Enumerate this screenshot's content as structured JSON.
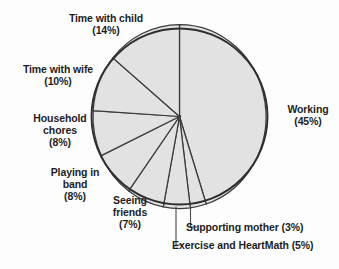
{
  "chart_data": {
    "type": "pie",
    "title": "",
    "subtitle": "",
    "xlabel": "",
    "ylabel": "",
    "grid": false,
    "legend_position": "callout-labels",
    "start_angle_deg": 0,
    "direction": "clockwise",
    "slice_fill_color": "#e2e2e2",
    "slice_border_color": "#3a3a3a",
    "background_color": "#fdfdfd",
    "categories": [
      "Working",
      "Supporting mother",
      "Exercise and HeartMath",
      "Seeing friends",
      "Playing in band",
      "Household chores",
      "Time with wife",
      "Time with child"
    ],
    "values": [
      45,
      3,
      5,
      7,
      8,
      8,
      10,
      14
    ],
    "total": 100,
    "slices": [
      {
        "name": "Working",
        "value": 45,
        "percent_label": "(45%)",
        "label_line1": "Working",
        "label_line2": "(45%)"
      },
      {
        "name": "Supporting mother",
        "value": 3,
        "percent_label": "(3%)",
        "label_line1": "Supporting mother (3%)",
        "label_line2": ""
      },
      {
        "name": "Exercise and HeartMath",
        "value": 5,
        "percent_label": "(5%)",
        "label_line1": "Exercise and HeartMath (5%)",
        "label_line2": ""
      },
      {
        "name": "Seeing friends",
        "value": 7,
        "percent_label": "(7%)",
        "label_line1": "Seeing",
        "label_line2": "friends",
        "label_line3": "(7%)"
      },
      {
        "name": "Playing in band",
        "value": 8,
        "percent_label": "(8%)",
        "label_line1": "Playing in",
        "label_line2": "band",
        "label_line3": "(8%)"
      },
      {
        "name": "Household chores",
        "value": 8,
        "percent_label": "(8%)",
        "label_line1": "Household",
        "label_line2": "chores",
        "label_line3": "(8%)"
      },
      {
        "name": "Time with wife",
        "value": 10,
        "percent_label": "(10%)",
        "label_line1": "Time with wife",
        "label_line2": "(10%)"
      },
      {
        "name": "Time with child",
        "value": 14,
        "percent_label": "(14%)",
        "label_line1": "Time with child",
        "label_line2": "(14%)"
      }
    ]
  },
  "labels": {
    "working": "Working\n(45%)",
    "time_with_child": "Time with child\n(14%)",
    "time_with_wife": "Time with wife\n(10%)",
    "household_chores": "Household\nchores\n(8%)",
    "playing_in_band": "Playing in\nband\n(8%)",
    "seeing_friends": "Seeing\nfriends\n(7%)",
    "supporting_mother": "Supporting mother (3%)",
    "exercise_heartmath": "Exercise and HeartMath (5%)"
  }
}
